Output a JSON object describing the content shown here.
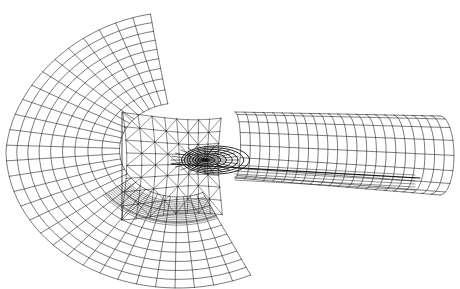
{
  "figure": {
    "title": "",
    "background": "#ffffff",
    "line_color": "#222222",
    "dense_color": "#111111",
    "outer_mesh": {
      "cx": 178,
      "cy": 150,
      "rx_outer": 172,
      "ry_outer": 138,
      "radial_count": 30,
      "ring_count": 9,
      "arc_start_deg": 100,
      "arc_end_deg": 295
    },
    "inner_block": {
      "x1": 122,
      "y1": 112,
      "x2": 225,
      "y2": 220,
      "tri_rows": 8,
      "tri_cols": 8
    },
    "core": {
      "cx": 205,
      "cy": 160,
      "rx": 34,
      "ry": 14,
      "rings": 8
    },
    "tail": {
      "x_start": 235,
      "x_end": 440,
      "upper_top_left": 112,
      "upper_top_right": 116,
      "lower_bottom_left": 178,
      "lower_bottom_right": 195,
      "columns": 22,
      "rows": 8
    }
  }
}
